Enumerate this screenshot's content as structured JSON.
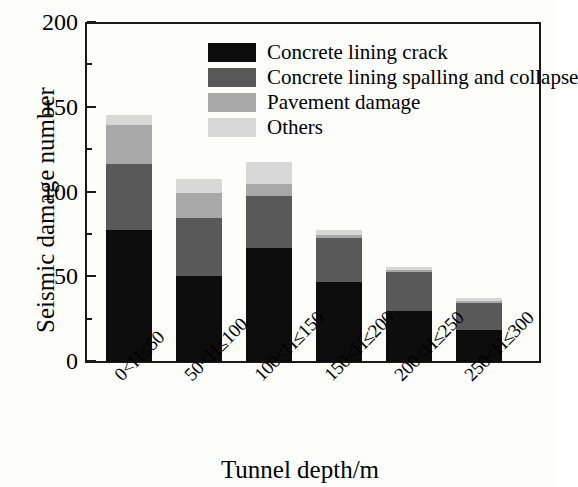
{
  "chart_data": {
    "type": "bar",
    "subtype": "stacked-vertical-bar",
    "title": "",
    "xlabel": "Tunnel depth/m",
    "ylabel": "Seismic damage number",
    "categories": [
      "0<H≤50",
      "50<H≤100",
      "100<H≤150",
      "150<H≤200",
      "200<H≤250",
      "250<H≤300"
    ],
    "series": [
      {
        "name": "Concrete lining crack",
        "color": "#0d0d0d",
        "values": [
          78,
          51,
          67,
          47,
          30,
          19
        ]
      },
      {
        "name": "Concrete lining spalling and collapse",
        "color": "#595959",
        "values": [
          39,
          34,
          31,
          26,
          23,
          16
        ]
      },
      {
        "name": "Pavement damage",
        "color": "#a8a8a8",
        "values": [
          23,
          15,
          7,
          2,
          1,
          1
        ]
      },
      {
        "name": "Others",
        "color": "#d8d8d8",
        "values": [
          6,
          8,
          13,
          3,
          2,
          2
        ]
      }
    ],
    "totals": [
      146,
      108,
      118,
      78,
      56,
      38
    ],
    "ylim": [
      0,
      200
    ],
    "ytick_labels": [
      "0",
      "50",
      "100",
      "150",
      "200"
    ],
    "ytick_values": [
      0,
      50,
      100,
      150,
      200
    ],
    "yminor_values": [
      25,
      75,
      125,
      175
    ],
    "grid": false,
    "legend_position": "top-right",
    "legend_entries": [
      "Concrete lining crack",
      "Concrete lining spalling and collapse",
      "Pavement damage",
      "Others"
    ]
  }
}
